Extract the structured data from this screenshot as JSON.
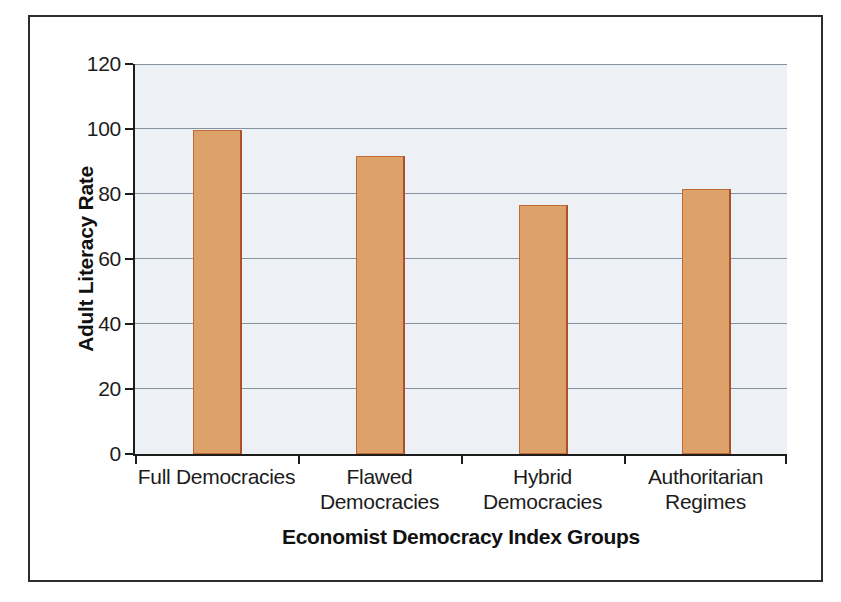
{
  "figure": {
    "background_color": "#ffffff",
    "border_color": "#2d2d2d"
  },
  "chart_data": {
    "type": "bar",
    "title": "",
    "categories": [
      "Full Democracies",
      "Flawed\nDemocracies",
      "Hybrid\nDemocracies",
      "Authoritarian\nRegimes"
    ],
    "values": [
      99,
      91,
      76,
      81
    ],
    "xlabel": "Economist Democracy Index Groups",
    "ylabel": "Adult Literacy Rate",
    "ylim": [
      0,
      120
    ],
    "yticks": [
      0,
      20,
      40,
      60,
      80,
      100,
      120
    ],
    "grid": "horizontal",
    "legend": "none",
    "bar_color": "#dda269",
    "bar_edge_color": "#ad4f28",
    "plot_bg_color": "#edf1f6",
    "gridline_color": "#8792a1",
    "axis_color": "#1c1c1c",
    "text_color": "#1c1c1c"
  }
}
